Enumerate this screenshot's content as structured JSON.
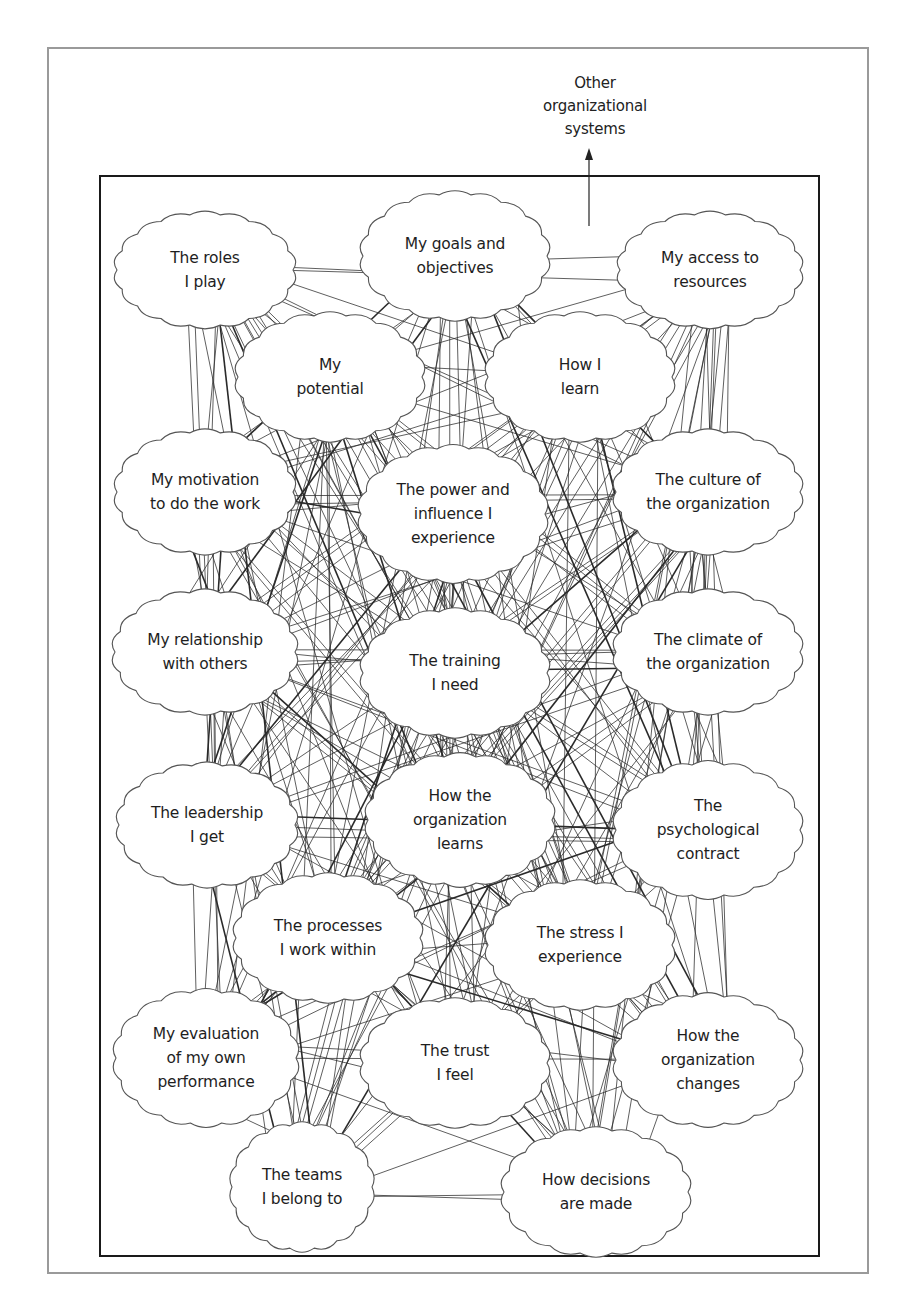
{
  "external": {
    "label_lines": [
      "Other",
      "organizational",
      "systems"
    ],
    "arrow": "up-arrow"
  },
  "nodes": [
    {
      "id": "roles",
      "lines": [
        "The roles",
        "I play"
      ],
      "cx": 205,
      "cy": 270,
      "rx": 88,
      "ry": 56
    },
    {
      "id": "goals",
      "lines": [
        "My goals and",
        "objectives"
      ],
      "cx": 455,
      "cy": 256,
      "rx": 92,
      "ry": 62
    },
    {
      "id": "resources",
      "lines": [
        "My access to",
        "resources"
      ],
      "cx": 710,
      "cy": 270,
      "rx": 90,
      "ry": 56
    },
    {
      "id": "potential",
      "lines": [
        "My",
        "potential"
      ],
      "cx": 330,
      "cy": 377,
      "rx": 92,
      "ry": 62
    },
    {
      "id": "learn",
      "lines": [
        "How I",
        "learn"
      ],
      "cx": 580,
      "cy": 377,
      "rx": 92,
      "ry": 62
    },
    {
      "id": "motivation",
      "lines": [
        "My motivation",
        "to do the work"
      ],
      "cx": 205,
      "cy": 492,
      "rx": 88,
      "ry": 60
    },
    {
      "id": "power",
      "lines": [
        "The power and",
        "influence I",
        "experience"
      ],
      "cx": 453,
      "cy": 514,
      "rx": 92,
      "ry": 66
    },
    {
      "id": "culture",
      "lines": [
        "The culture of",
        "the organization"
      ],
      "cx": 708,
      "cy": 492,
      "rx": 92,
      "ry": 60
    },
    {
      "id": "relationship",
      "lines": [
        "My relationship",
        "with others"
      ],
      "cx": 205,
      "cy": 652,
      "rx": 90,
      "ry": 60
    },
    {
      "id": "training",
      "lines": [
        "The training",
        "I need"
      ],
      "cx": 455,
      "cy": 673,
      "rx": 92,
      "ry": 62
    },
    {
      "id": "climate",
      "lines": [
        "The climate of",
        "the organization"
      ],
      "cx": 708,
      "cy": 652,
      "rx": 92,
      "ry": 60
    },
    {
      "id": "leadership",
      "lines": [
        "The leadership",
        "I get"
      ],
      "cx": 207,
      "cy": 825,
      "rx": 88,
      "ry": 60
    },
    {
      "id": "orglearns",
      "lines": [
        "How the",
        "organization",
        "learns"
      ],
      "cx": 460,
      "cy": 820,
      "rx": 92,
      "ry": 64
    },
    {
      "id": "psych",
      "lines": [
        "The",
        "psychological",
        "contract"
      ],
      "cx": 708,
      "cy": 830,
      "rx": 92,
      "ry": 66
    },
    {
      "id": "processes",
      "lines": [
        "The processes",
        "I work within"
      ],
      "cx": 328,
      "cy": 938,
      "rx": 92,
      "ry": 62
    },
    {
      "id": "stress",
      "lines": [
        "The stress I",
        "experience"
      ],
      "cx": 580,
      "cy": 945,
      "rx": 92,
      "ry": 62
    },
    {
      "id": "evaluation",
      "lines": [
        "My evaluation",
        "of my own",
        "performance"
      ],
      "cx": 206,
      "cy": 1058,
      "rx": 90,
      "ry": 66
    },
    {
      "id": "trust",
      "lines": [
        "The trust",
        "I feel"
      ],
      "cx": 455,
      "cy": 1063,
      "rx": 92,
      "ry": 62
    },
    {
      "id": "orgchanges",
      "lines": [
        "How the",
        "organization",
        "changes"
      ],
      "cx": 708,
      "cy": 1060,
      "rx": 92,
      "ry": 64
    },
    {
      "id": "teams",
      "lines": [
        "The teams",
        "I belong to"
      ],
      "cx": 302,
      "cy": 1187,
      "rx": 70,
      "ry": 62
    },
    {
      "id": "decisions",
      "lines": [
        "How decisions",
        "are made"
      ],
      "cx": 596,
      "cy": 1192,
      "rx": 92,
      "ry": 62
    }
  ],
  "colors": {
    "outer_frame": "#9a9a9a",
    "inner_frame": "#1a1a1a",
    "cloud_stroke": "#555555",
    "edge": "#2a2a2a",
    "text": "#1e1e1e"
  }
}
